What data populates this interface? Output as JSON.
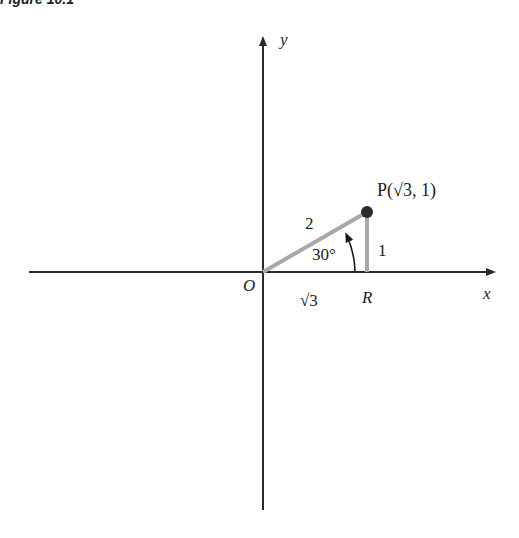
{
  "figure": {
    "caption": "Figure 10.1"
  },
  "axes": {
    "x_label": "x",
    "y_label": "y",
    "origin_label": "O"
  },
  "triangle": {
    "point_label": "P(√3, 1)",
    "foot_label": "R",
    "hypotenuse_label": "2",
    "adjacent_label": "√3",
    "opposite_label": "1",
    "angle_label": "30°"
  },
  "colors": {
    "axis": "#2a2a2a",
    "segment": "#a8a8a8",
    "point": "#2a2a2a",
    "text": "#222222"
  }
}
